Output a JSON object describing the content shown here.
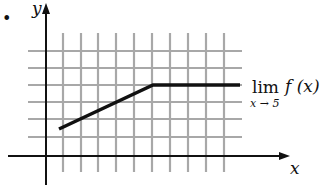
{
  "figure": {
    "bullet": "•",
    "axes": {
      "x_label": "x",
      "y_label": "y"
    },
    "grid": {
      "vertical_lines": 10,
      "horizontal_lines": 6,
      "color": "#a8a8a8"
    },
    "graph": {
      "color": "#111111",
      "description": "Line segment rising from left, then a horizontal segment to the right",
      "points_px": [
        [
          59,
          129
        ],
        [
          153,
          85
        ],
        [
          240,
          85
        ]
      ]
    },
    "annotation": {
      "lim": "lim",
      "func": "f (x)",
      "subscript": "x → 5"
    }
  }
}
